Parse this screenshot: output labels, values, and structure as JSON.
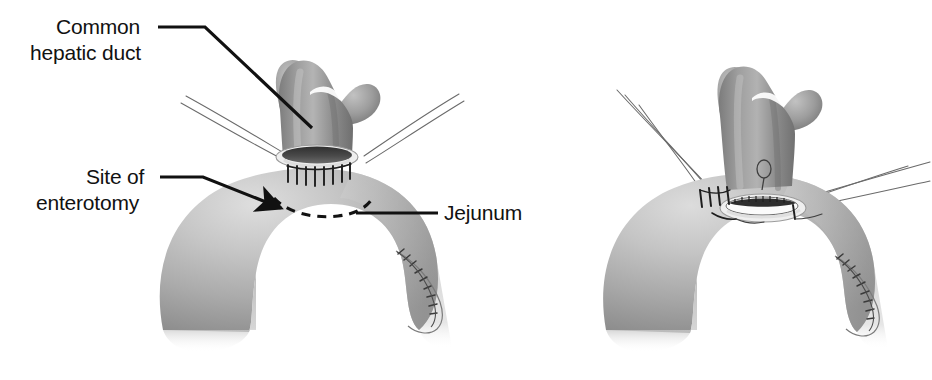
{
  "figure": {
    "type": "medical-illustration",
    "modality": "grayscale line-and-tone drawing",
    "panel_count": 2,
    "background_color": "#ffffff",
    "line_color": "#111111",
    "tissue_colors": {
      "duct_mid": "#8d8d8d",
      "duct_light": "#b9b9b9",
      "duct_dark": "#6e6e6e",
      "bowel_light": "#d2d2d2",
      "bowel_mid": "#a9a9a9",
      "bowel_dark": "#838383",
      "lumen_dark": "#3a3a3a",
      "lumen_open": "#fbfbfb",
      "suture_thread": "#5a5a5a",
      "rim_highlight": "#eeeeee"
    }
  },
  "labels": [
    {
      "id": "common-hepatic-duct",
      "line1": "Common",
      "line2": "hepatic duct",
      "panel": "left",
      "points_to": "proximal common hepatic duct"
    },
    {
      "id": "site-of-enterotomy",
      "line1": "Site of",
      "line2": "enterotomy",
      "panel": "left",
      "points_to": "dashed enterotomy outline on jejunum"
    },
    {
      "id": "jejunum",
      "line1": "Jejunum",
      "line2": "",
      "panel": "left",
      "points_to": "jejunal loop"
    }
  ],
  "panels": [
    {
      "id": "panel-left",
      "position": "left",
      "description": "Common hepatic duct with bifurcation sutured to jejunal loop; dashed line marks planned enterotomy; stay sutures retract laterally; stapled jejunal stump at lower right.",
      "features": [
        "bifurcated common hepatic duct",
        "posterior row of interrupted sutures",
        "dashed enterotomy marking",
        "jejunal loop",
        "stapled jejunal stump",
        "retraction stay sutures"
      ],
      "suture_count": 8
    },
    {
      "id": "panel-right",
      "position": "right",
      "description": "Enterotomy has been opened revealing the lumen; anastomotic sutures placed along the left side; additional stay sutures held laterally with a knot loop at upper right.",
      "features": [
        "bifurcated common hepatic duct",
        "opened enterotomy lumen",
        "placed anastomotic sutures",
        "suture knot loop",
        "jejunal loop",
        "stapled jejunal stump"
      ],
      "suture_count": 5
    }
  ]
}
